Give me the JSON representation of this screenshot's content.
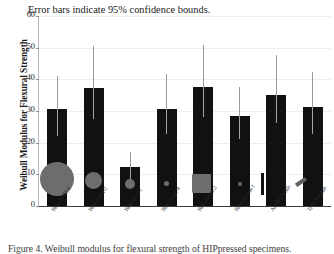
{
  "chart_data": {
    "type": "bar",
    "title": "",
    "annotation": "Error bars indicate 95% confidence bounds.",
    "xlabel": "",
    "ylabel": "Weibull Modulus for Flexural Strength",
    "ylim": [
      0,
      60
    ],
    "yticks": [
      0,
      10,
      20,
      30,
      40,
      50,
      60
    ],
    "grid": true,
    "legend_position": "none",
    "categories": [
      "BiAs EDM-d",
      "BiAs EDM-2",
      "BiAs D1.5-1",
      "BiAs Diam-4",
      "BiAs DiGO-2",
      "BiAs Anneal-1",
      "As-HPI Polish",
      "Tr-HPI Polish"
    ],
    "values": [
      30.6,
      37.4,
      12.4,
      30.6,
      37.6,
      28.4,
      35.2,
      31.2
    ],
    "ci_upper": [
      41.0,
      50.6,
      17.0,
      41.8,
      50.8,
      37.6,
      47.8,
      42.4
    ],
    "ci_lower": [
      22.2,
      27.4,
      8.6,
      22.8,
      28.0,
      21.0,
      26.2,
      22.8
    ],
    "markers": [
      {
        "shape": "circle",
        "size": 34,
        "value": 8.5
      },
      {
        "shape": "circle",
        "size": 17,
        "value": 8.0
      },
      {
        "shape": "circle",
        "size": 10,
        "value": 7.0
      },
      {
        "shape": "circle",
        "size": 5,
        "value": 7.0
      },
      {
        "shape": "square",
        "size": 19,
        "value": 7.0
      },
      {
        "shape": "circle",
        "size": 4,
        "value": 7.0
      },
      {
        "shape": "vbar",
        "size": 3,
        "value": 7.0
      },
      {
        "shape": "slash",
        "size": 12,
        "value": 7.5
      }
    ],
    "marker_color": "#6d6d6d",
    "bar_color": "#111111",
    "error_color": "#9b9b9b"
  },
  "caption": "Figure 4.  Weibull modulus for flexural strength of HIPpressed specimens."
}
